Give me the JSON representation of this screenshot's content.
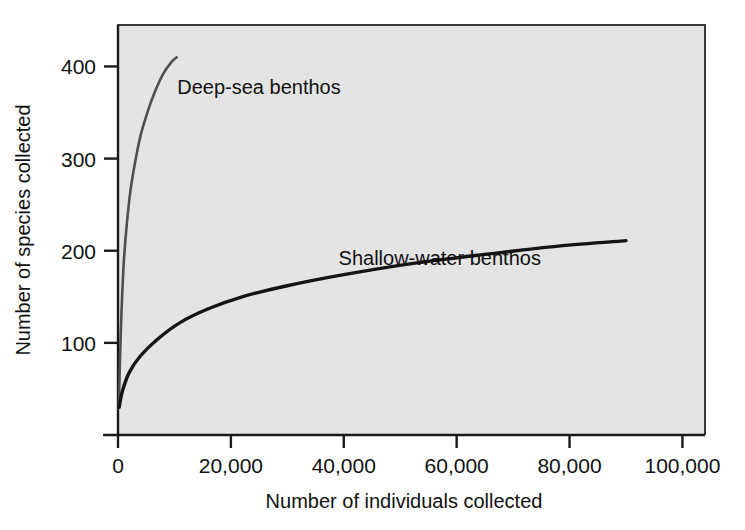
{
  "chart_data": {
    "type": "line",
    "title": "",
    "xlabel": "Number of individuals collected",
    "ylabel": "Number of species collected",
    "xlim": [
      0,
      104000
    ],
    "ylim": [
      0,
      445
    ],
    "grid": false,
    "legend_position": "inline-annotation",
    "xticks": [
      0,
      20000,
      40000,
      60000,
      80000,
      100000
    ],
    "xtick_labels": [
      "0",
      "20,000",
      "40,000",
      "60,000",
      "80,000",
      "100,000"
    ],
    "yticks": [
      100,
      200,
      300,
      400
    ],
    "ytick_labels": [
      "100",
      "200",
      "300",
      "400"
    ],
    "plot_background": "#e4e4e4",
    "series": [
      {
        "name": "Deep-sea benthos",
        "color": "#4f4f4f",
        "line_width": 2.6,
        "annotation": "Deep-sea benthos",
        "x": [
          150,
          300,
          600,
          1000,
          1500,
          2200,
          3000,
          4000,
          5200,
          6500,
          8000,
          9500,
          10400
        ],
        "values": [
          30,
          70,
          130,
          185,
          225,
          265,
          295,
          325,
          350,
          372,
          392,
          405,
          410
        ]
      },
      {
        "name": "Shallow-water benthos",
        "color": "#141414",
        "line_width": 3.4,
        "annotation": "Shallow-water benthos",
        "x": [
          200,
          800,
          2000,
          4000,
          7000,
          11000,
          16000,
          22000,
          30000,
          40000,
          52000,
          65000,
          78000,
          90000
        ],
        "values": [
          30,
          48,
          68,
          86,
          104,
          122,
          137,
          150,
          162,
          174,
          186,
          196,
          205,
          211
        ]
      }
    ],
    "annotations": [
      {
        "text": "Deep-sea benthos",
        "x": 10500,
        "y": 370
      },
      {
        "text": "Shallow-water benthos",
        "x": 57000,
        "y": 185
      }
    ]
  }
}
